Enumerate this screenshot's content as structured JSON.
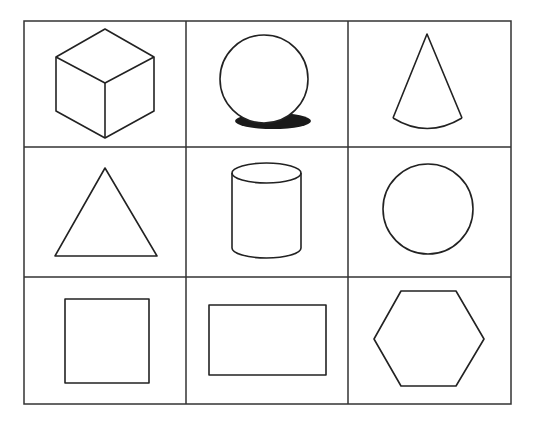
{
  "diagram": {
    "title": "",
    "layout": {
      "rows": 3,
      "columns": 3
    },
    "colors": {
      "stroke": "#222222",
      "grid": "#333333",
      "shadow": "#1a1a1a",
      "background": "#ffffff"
    },
    "cells": [
      {
        "row": 1,
        "col": 1,
        "shape": "cube"
      },
      {
        "row": 1,
        "col": 2,
        "shape": "sphere-with-shadow"
      },
      {
        "row": 1,
        "col": 3,
        "shape": "cone"
      },
      {
        "row": 2,
        "col": 1,
        "shape": "triangle"
      },
      {
        "row": 2,
        "col": 2,
        "shape": "cylinder"
      },
      {
        "row": 2,
        "col": 3,
        "shape": "circle"
      },
      {
        "row": 3,
        "col": 1,
        "shape": "square"
      },
      {
        "row": 3,
        "col": 2,
        "shape": "rectangle"
      },
      {
        "row": 3,
        "col": 3,
        "shape": "hexagon"
      }
    ]
  }
}
